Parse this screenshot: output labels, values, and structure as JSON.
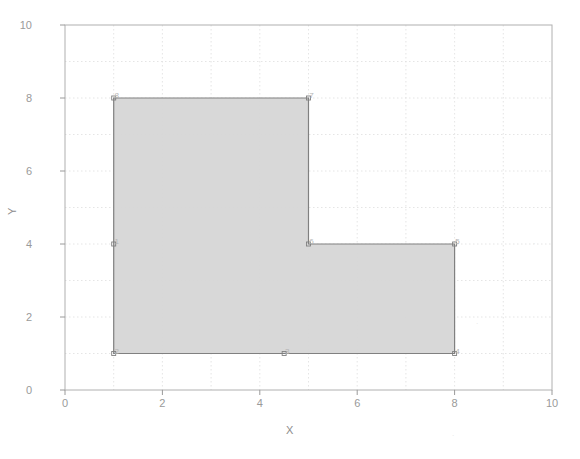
{
  "chart_data": {
    "type": "line",
    "title": "",
    "xlabel": "X",
    "ylabel": "Y",
    "xlim": [
      0,
      10
    ],
    "ylim": [
      0,
      10
    ],
    "xticks": [
      0,
      2,
      4,
      6,
      8,
      10
    ],
    "yticks": [
      0,
      2,
      4,
      6,
      8,
      10
    ],
    "grid": true,
    "grid_style": "dotted",
    "grid_spacing": 1,
    "legend": null,
    "series": [
      {
        "name": "polygon",
        "type": "closed-polygon-filled",
        "fill_color": "#d6d6d6",
        "line_color": "#808080",
        "points": [
          {
            "label": "1",
            "x": 1,
            "y": 4
          },
          {
            "label": "2",
            "x": 1,
            "y": 1
          },
          {
            "label": "3",
            "x": 4.5,
            "y": 1
          },
          {
            "label": "4",
            "x": 8,
            "y": 1
          },
          {
            "label": "5",
            "x": 8,
            "y": 4
          },
          {
            "label": "6",
            "x": 5,
            "y": 4
          },
          {
            "label": "7",
            "x": 5,
            "y": 8
          },
          {
            "label": "8",
            "x": 1,
            "y": 8
          }
        ]
      }
    ]
  },
  "axes": {
    "x_label": "X",
    "y_label": "Y",
    "x_tick_labels": [
      "0",
      "2",
      "4",
      "6",
      "8",
      "10"
    ],
    "y_tick_labels": [
      "0",
      "2",
      "4",
      "6",
      "8",
      "10"
    ]
  },
  "vertex_labels": [
    "1",
    "2",
    "3",
    "4",
    "5",
    "6",
    "7",
    "8"
  ],
  "colors": {
    "fill": "#d6d6d6",
    "stroke": "#808080",
    "axis": "#9a9a9a",
    "grid": "#dedede",
    "background": "#ffffff",
    "label_text": "#9a9a9a"
  }
}
